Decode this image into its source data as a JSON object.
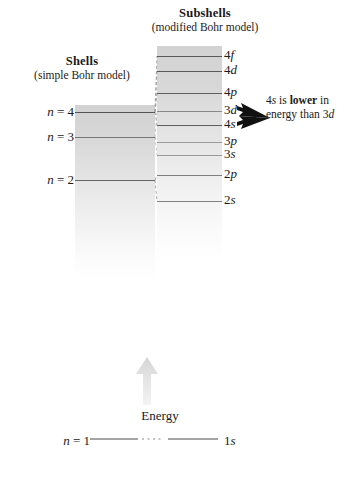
{
  "diagram": {
    "shells_panel": {
      "title": "Shells",
      "subtitle": "(simple Bohr model)",
      "levels": [
        {
          "label_n": "n = 4",
          "n": 4,
          "y": 112,
          "thickness": 1.6,
          "color": "#555555"
        },
        {
          "label_n": "n = 3",
          "n": 3,
          "y": 137,
          "thickness": 1.1,
          "color": "#777777"
        },
        {
          "label_n": "n = 2",
          "n": 2,
          "y": 180,
          "thickness": 1.4,
          "color": "#666666"
        }
      ]
    },
    "subshells_panel": {
      "title": "Subshells",
      "subtitle": "(modified Bohr model)",
      "levels": [
        {
          "label": "4f",
          "y": 56,
          "thickness": 1.6,
          "color": "#5a5a5a"
        },
        {
          "label": "4d",
          "y": 71,
          "thickness": 1.6,
          "color": "#5a5a5a"
        },
        {
          "label": "4p",
          "y": 93,
          "thickness": 1.6,
          "color": "#5f5f5f"
        },
        {
          "label": "3d",
          "y": 111,
          "thickness": 1.1,
          "color": "#8a8a8a"
        },
        {
          "label": "4s",
          "y": 125,
          "thickness": 1.6,
          "color": "#5f5f5f"
        },
        {
          "label": "3p",
          "y": 142,
          "thickness": 1.0,
          "color": "#9a9a9a"
        },
        {
          "label": "3s",
          "y": 155,
          "thickness": 1.0,
          "color": "#9a9a9a"
        },
        {
          "label": "2p",
          "y": 175,
          "thickness": 1.2,
          "color": "#808080"
        },
        {
          "label": "2s",
          "y": 201,
          "thickness": 1.2,
          "color": "#808080"
        }
      ]
    },
    "annotation": {
      "part1": "4s is ",
      "emphasis": "lower",
      "part2": " in energy than 3d",
      "text_full": "4s is lower in energy than 3d"
    },
    "energy_axis": {
      "label": "Energy",
      "arrow_direction": "up",
      "arrow_color": "#e0e0e0"
    },
    "ground_state": {
      "n_label": "n = 1",
      "subshell_label": "1s"
    },
    "colors": {
      "background": "#ffffff",
      "text": "#1a1a1a",
      "band_top": "#d2d2d2",
      "connector": "#9b9b9b",
      "arrow": "#111111"
    }
  }
}
